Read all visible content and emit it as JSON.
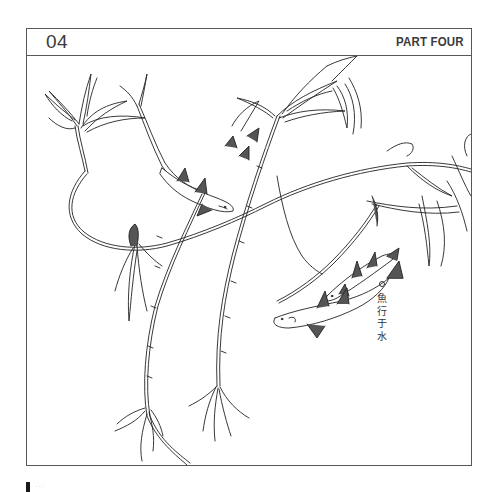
{
  "header": {
    "chapter_number": "04",
    "part_label": "PART FOUR"
  },
  "illustration": {
    "subject": "willow branches with fish swimming (line art)",
    "icon": "willow-fish-illustration"
  },
  "caption": {
    "marker": "circle-bullet",
    "characters": [
      "魚",
      "行",
      "于",
      "水"
    ]
  },
  "footer": {
    "marker": "page-marker-bar",
    "text": "···"
  },
  "colors": {
    "border": "#585858",
    "text": "#3a3a3a",
    "ink": "#222222",
    "background": "#ffffff"
  }
}
